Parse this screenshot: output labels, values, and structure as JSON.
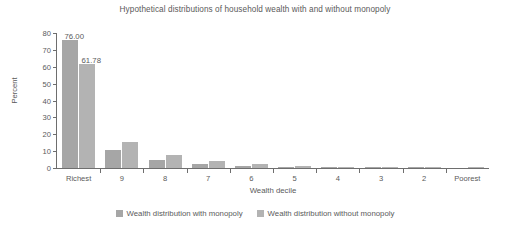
{
  "chart_data": {
    "type": "bar",
    "title": "Hypothetical distributions of household wealth with and without monopoly",
    "xlabel": "Wealth decile",
    "ylabel": "Percent",
    "categories": [
      "Richest",
      "9",
      "8",
      "7",
      "6",
      "5",
      "4",
      "3",
      "2",
      "Poorest"
    ],
    "series": [
      {
        "name": "Wealth distribution with monopoly",
        "color": "#a6a6a6",
        "values": [
          76.0,
          10.5,
          4.6,
          2.2,
          1.2,
          0.7,
          0.4,
          0.2,
          0.1,
          0.0
        ]
      },
      {
        "name": "Wealth distribution without monopoly",
        "color": "#b3b3b3",
        "values": [
          61.78,
          15.2,
          7.8,
          4.0,
          2.3,
          1.3,
          0.7,
          0.4,
          0.2,
          0.1
        ]
      }
    ],
    "data_labels": [
      {
        "text": "76.00",
        "series": 0,
        "category": "Richest"
      },
      {
        "text": "61.78",
        "series": 1,
        "category": "Richest"
      }
    ],
    "ylim": [
      0,
      80
    ],
    "yticks": [
      0,
      10,
      20,
      30,
      40,
      50,
      60,
      70,
      80
    ],
    "ytick_labels": [
      "0",
      "10",
      "20",
      "30",
      "40",
      "50",
      "60",
      "70",
      "80"
    ],
    "grid": false,
    "legend_position": "bottom"
  },
  "axis": {
    "y_title": "Percent",
    "x_title": "Wealth decile"
  }
}
